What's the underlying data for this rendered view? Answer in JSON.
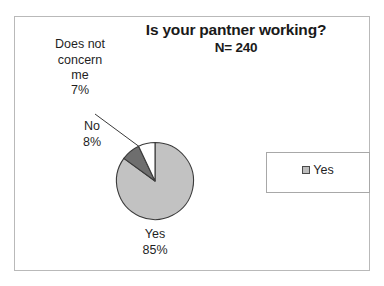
{
  "chart_data": {
    "type": "pie",
    "title": "Is your pantner working?",
    "subtitle": "N= 240",
    "sample_size": 240,
    "categories": [
      "Yes",
      "No",
      "Does not concern me"
    ],
    "values": [
      85,
      8,
      7
    ],
    "value_unit": "%",
    "labels": [
      {
        "name": "Yes",
        "percent": "85%",
        "text_line1": "Yes",
        "text_line2": "85%",
        "color": "#c2c2c2"
      },
      {
        "name": "No",
        "percent": "8%",
        "text_line1": "No",
        "text_line2": "8%",
        "color": "#6e6e6e"
      },
      {
        "name": "Does not concern me",
        "percent": "7%",
        "text_line1": "Does not\nconcern\nme",
        "text_line2": "7%",
        "color": "#ffffff"
      }
    ],
    "legend": {
      "position": "right",
      "entries": [
        {
          "label": "Yes",
          "color": "#bdbdbd"
        }
      ]
    },
    "grid": false,
    "xlabel": "",
    "ylabel": ""
  },
  "colors": {
    "slice_yes": "#c2c2c2",
    "slice_no": "#6e6e6e",
    "slice_dnc": "#ffffff",
    "outline": "#3a3a3a",
    "frame_border": "#b9b9b9",
    "legend_border": "#a8a8a8",
    "text": "#1f1f1f"
  }
}
